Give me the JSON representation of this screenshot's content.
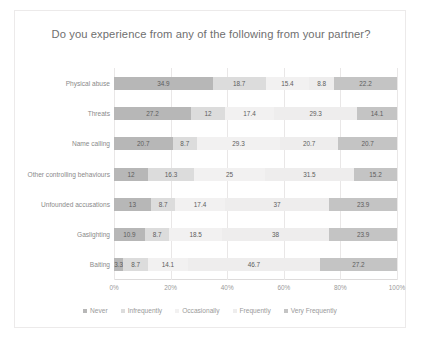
{
  "chart_data": {
    "type": "bar",
    "orientation": "horizontal",
    "stacked": "100%",
    "title": "Do you experience from any of the following from your partner?",
    "xlabel": "",
    "ylabel": "",
    "xlim": [
      0,
      100
    ],
    "grid": true,
    "legend_position": "bottom",
    "xticks": [
      "0%",
      "20%",
      "40%",
      "60%",
      "80%",
      "100%"
    ],
    "categories": [
      "Physical abuse",
      "Threats",
      "Name calling",
      "Other controlling behaviours",
      "Unfounded accusations",
      "Gaslighting",
      "Baiting"
    ],
    "series": [
      {
        "name": "Never",
        "color": "#b7b7b7",
        "values": [
          34.9,
          27.2,
          20.7,
          12,
          13,
          10.9,
          3.3
        ]
      },
      {
        "name": "Infrequently",
        "color": "#dcdcdc",
        "values": [
          18.7,
          12,
          8.7,
          16.3,
          8.7,
          8.7,
          8.7
        ]
      },
      {
        "name": "Occasionally",
        "color": "#f2f1f1",
        "values": [
          15.4,
          17.4,
          29.3,
          25,
          17.4,
          18.5,
          14.1
        ]
      },
      {
        "name": "Frequently",
        "color": "#eeeded",
        "values": [
          8.8,
          29.3,
          20.7,
          31.5,
          37,
          38,
          46.7
        ]
      },
      {
        "name": "Very Frequently",
        "color": "#c4c4c4",
        "values": [
          22.2,
          14.1,
          20.7,
          15.2,
          23.9,
          23.9,
          27.2
        ]
      }
    ],
    "data_labels": [
      [
        "34.9",
        "18.7",
        "15.4",
        "8.8",
        "22.2"
      ],
      [
        "27.2",
        "12",
        "17.4",
        "29.3",
        "14.1"
      ],
      [
        "20.7",
        "8.7",
        "29.3",
        "20.7",
        "20.7"
      ],
      [
        "12",
        "16.3",
        "25",
        "31.5",
        "15.2"
      ],
      [
        "13",
        "8.7",
        "17.4",
        "37",
        "23.9"
      ],
      [
        "10.9",
        "8.7",
        "18.5",
        "38",
        "23.9"
      ],
      [
        "3.3",
        "8.7",
        "14.1",
        "46.7",
        "27.2"
      ]
    ]
  }
}
